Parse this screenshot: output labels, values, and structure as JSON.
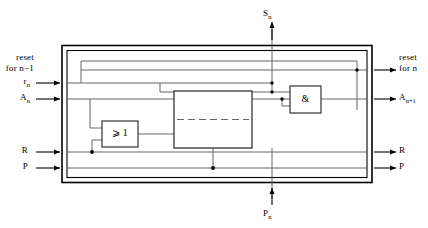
{
  "figure": {
    "type": "logic-block-diagram"
  },
  "labels": {
    "reset_for_prev_line1": "reset",
    "reset_for_prev_line2": "for n−1",
    "r_n": "r",
    "r_n_sub": "n",
    "a_n": "A",
    "a_n_sub": "n",
    "r_left": "R",
    "p_left": "P",
    "s_n": "S",
    "s_n_sub": "n",
    "p_n": "P",
    "p_n_sub": "n",
    "reset_for_n_line1": "reset",
    "reset_for_n_line2": "for  n",
    "a_n1": "A",
    "a_n1_sub": "n+1",
    "r_right": "R",
    "p_right": "P"
  },
  "gates": {
    "or_gate": "⩾ 1",
    "and_gate": "&",
    "center_block": ""
  },
  "colors": {
    "line": "#000000",
    "background": "#ffffff",
    "wire": "#4a4a4a"
  },
  "ports": {
    "inputs_left": [
      "r_n",
      "A_n",
      "R",
      "P"
    ],
    "inputs_bottom": [
      "P_n"
    ],
    "outputs_right": [
      "reset for n",
      "A_n+1",
      "R",
      "P"
    ],
    "outputs_top": [
      "S_n"
    ]
  }
}
